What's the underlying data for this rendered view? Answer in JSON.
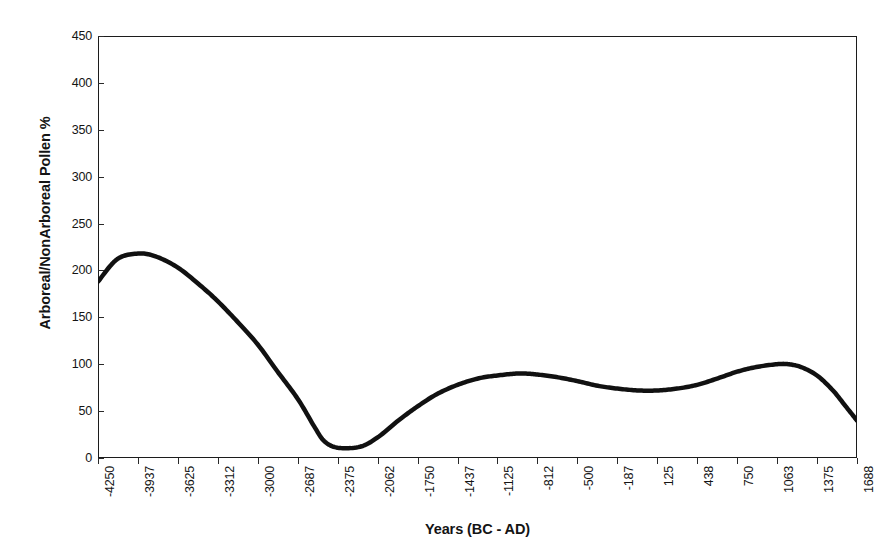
{
  "chart_data": {
    "type": "line",
    "title": "",
    "xlabel": "Years (BC - AD)",
    "ylabel": "Arboreal/NonArboreal Pollen %",
    "ylim": [
      0,
      450
    ],
    "ytick_values": [
      0,
      50,
      100,
      150,
      200,
      250,
      300,
      350,
      400,
      450
    ],
    "ytick_labels": [
      "0",
      "50",
      "100",
      "150",
      "200",
      "250",
      "300",
      "350",
      "400",
      "450"
    ],
    "xtick_labels": [
      "-4250",
      "-3937",
      "-3625",
      "-3312",
      "-3000",
      "-2687",
      "-2375",
      "-2062",
      "-1750",
      "-1437",
      "-1125",
      "-812",
      "-500",
      "-187",
      "125",
      "438",
      "750",
      "1063",
      "1375",
      "1688"
    ],
    "xtick_values": [
      -4250,
      -3937,
      -3625,
      -3312,
      -3000,
      -2687,
      -2375,
      -2062,
      -1750,
      -1437,
      -1125,
      -812,
      -500,
      -187,
      125,
      438,
      750,
      1063,
      1375,
      1688
    ],
    "xlim": [
      -4250,
      1688
    ],
    "grid": false,
    "legend": false,
    "legend_position": "none",
    "series": [
      {
        "name": "Arboreal/NonArboreal Pollen %",
        "color": "#111111",
        "line_width": 4.5,
        "x": [
          -4250,
          -4100,
          -3937,
          -3800,
          -3625,
          -3450,
          -3312,
          -3150,
          -3000,
          -2850,
          -2687,
          -2560,
          -2480,
          -2375,
          -2200,
          -2062,
          -1900,
          -1750,
          -1600,
          -1437,
          -1270,
          -1125,
          -980,
          -900,
          -812,
          -650,
          -500,
          -340,
          -187,
          -20,
          125,
          280,
          438,
          600,
          750,
          900,
          1063,
          1150,
          1250,
          1375,
          1500,
          1600,
          1688
        ],
        "y": [
          188,
          212,
          218,
          215,
          203,
          184,
          167,
          144,
          121,
          93,
          63,
          34,
          18,
          11,
          12,
          22,
          40,
          55,
          68,
          78,
          85,
          88,
          90,
          90,
          89,
          86,
          82,
          77,
          74,
          72,
          72,
          74,
          78,
          85,
          92,
          97,
          100,
          100,
          97,
          88,
          72,
          55,
          40
        ]
      }
    ]
  }
}
